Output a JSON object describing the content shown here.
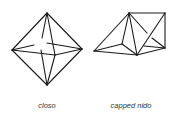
{
  "figure": {
    "shapes": [
      {
        "id": "closo",
        "label": "closo",
        "description": "octahedron",
        "vertices": {
          "top": [
            47,
            13
          ],
          "left": [
            12,
            50
          ],
          "right": [
            82,
            49
          ],
          "bottom": [
            47,
            85
          ],
          "front": [
            55,
            55
          ],
          "back": [
            40,
            44
          ]
        }
      },
      {
        "id": "capped-nido",
        "label": "capped nido",
        "description": "capped square pyramid",
        "vertices": {
          "apex": [
            129,
            13
          ],
          "top_right": [
            165,
            13
          ],
          "left": [
            94,
            51
          ],
          "bottom": [
            137,
            55
          ],
          "right": [
            165,
            48
          ],
          "inner_back": [
            122,
            44
          ]
        }
      }
    ],
    "line_color": "#1a1a1a",
    "label_color": "#333333"
  }
}
